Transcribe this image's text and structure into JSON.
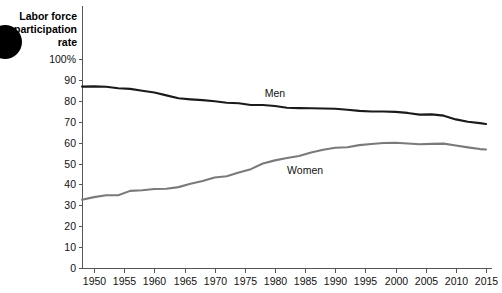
{
  "chart_data": {
    "type": "line",
    "title_lines": [
      "Labor force",
      "participation",
      "rate"
    ],
    "xlabel": "",
    "ylabel": "Labor force participation rate",
    "xlim": [
      1948,
      2016
    ],
    "ylim": [
      0,
      100
    ],
    "grid": false,
    "legend_position": "inline-annotation",
    "yticks": [
      0,
      10,
      20,
      30,
      40,
      50,
      60,
      70,
      80,
      90,
      100
    ],
    "ytick_labels": [
      "0",
      "10",
      "20",
      "30",
      "40",
      "50",
      "60",
      "70",
      "80",
      "90",
      "100%"
    ],
    "xticks": [
      1950,
      1955,
      1960,
      1965,
      1970,
      1975,
      1980,
      1985,
      1990,
      1995,
      2000,
      2005,
      2010,
      2015
    ],
    "xtick_labels": [
      "1950",
      "1955",
      "1960",
      "1965",
      "1970",
      "1975",
      "1980",
      "1985",
      "1990",
      "1995",
      "2000",
      "2005",
      "2010",
      "2015"
    ],
    "x": [
      1948,
      1950,
      1952,
      1954,
      1956,
      1958,
      1960,
      1962,
      1964,
      1966,
      1968,
      1970,
      1972,
      1974,
      1976,
      1978,
      1980,
      1982,
      1984,
      1986,
      1988,
      1990,
      1992,
      1994,
      1996,
      1998,
      2000,
      2002,
      2004,
      2006,
      2008,
      2010,
      2012,
      2014,
      2015
    ],
    "series": [
      {
        "name": "Men",
        "color": "#1a1a1a",
        "label": "Men",
        "label_x": 1980,
        "label_y": 82,
        "values": [
          86.8,
          86.9,
          86.7,
          86.0,
          85.7,
          84.8,
          84.0,
          82.6,
          81.2,
          80.7,
          80.3,
          79.8,
          79.1,
          78.8,
          78.0,
          78.0,
          77.5,
          76.7,
          76.5,
          76.4,
          76.3,
          76.2,
          75.7,
          75.2,
          74.9,
          74.9,
          74.7,
          74.2,
          73.4,
          73.5,
          72.9,
          71.1,
          70.0,
          69.3,
          68.9
        ]
      },
      {
        "name": "Women",
        "color": "#7a7a7a",
        "label": "Women",
        "label_x": 1985,
        "label_y": 45,
        "values": [
          32.7,
          33.9,
          34.8,
          34.8,
          36.9,
          37.2,
          37.8,
          37.9,
          38.7,
          40.3,
          41.6,
          43.3,
          43.9,
          45.7,
          47.3,
          50.0,
          51.5,
          52.6,
          53.6,
          55.3,
          56.6,
          57.5,
          57.8,
          58.8,
          59.3,
          59.8,
          59.9,
          59.6,
          59.2,
          59.4,
          59.5,
          58.6,
          57.7,
          56.9,
          56.7
        ]
      }
    ]
  },
  "decoration": {
    "corner_blob": "black-circle"
  }
}
